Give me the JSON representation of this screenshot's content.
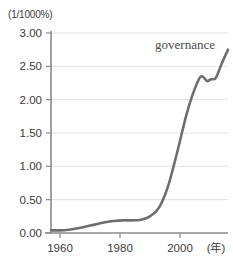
{
  "chart_data": {
    "type": "line",
    "title": "",
    "subtitle": "",
    "xlabel": "(年)",
    "ylabel": "(1/1000%)",
    "unit_label": "(1/1000%)",
    "grid": true,
    "legend_position": "inline-right",
    "series_label": "governance",
    "xlim": [
      1957,
      2016
    ],
    "ylim": [
      0.0,
      3.0
    ],
    "xticks": [
      1960,
      1980,
      2000
    ],
    "xtick_labels": [
      "1960",
      "1980",
      "2000"
    ],
    "yticks": [
      0.0,
      0.5,
      1.0,
      1.5,
      2.0,
      2.5,
      3.0
    ],
    "ytick_labels": [
      "0.00",
      "0.50",
      "1.00",
      "1.50",
      "2.00",
      "2.50",
      "3.00"
    ],
    "series": [
      {
        "name": "governance",
        "color": "#6e6e6e",
        "x": [
          1957,
          1960,
          1963,
          1966,
          1969,
          1972,
          1975,
          1978,
          1981,
          1984,
          1987,
          1990,
          1993,
          1996,
          1999,
          2002,
          2004,
          2006,
          2007,
          2008,
          2009,
          2010,
          2011,
          2012,
          2014,
          2016
        ],
        "values": [
          0.04,
          0.04,
          0.05,
          0.07,
          0.1,
          0.13,
          0.16,
          0.18,
          0.19,
          0.19,
          0.2,
          0.25,
          0.38,
          0.7,
          1.2,
          1.75,
          2.05,
          2.28,
          2.35,
          2.33,
          2.28,
          2.3,
          2.31,
          2.33,
          2.55,
          2.75
        ]
      }
    ],
    "annotations": [
      {
        "text": "governance",
        "x": 2006,
        "y": 2.85
      }
    ],
    "colors": {
      "line": "#6e6e6e",
      "grid": "#e2e2e2",
      "axis": "#8a8a8a",
      "text": "#3b3b3b",
      "background": "#ffffff"
    }
  }
}
